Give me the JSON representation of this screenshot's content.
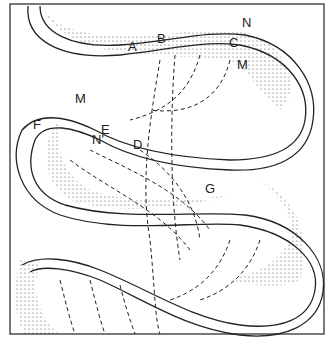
{
  "diagram": {
    "labels": [
      {
        "id": "A",
        "text": "A",
        "x": 128,
        "y": 40
      },
      {
        "id": "B",
        "text": "B",
        "x": 157,
        "y": 32
      },
      {
        "id": "C",
        "text": "C",
        "x": 229,
        "y": 36
      },
      {
        "id": "N1",
        "text": "N",
        "x": 242,
        "y": 16
      },
      {
        "id": "M1",
        "text": "M",
        "x": 237,
        "y": 58
      },
      {
        "id": "M2",
        "text": "M",
        "x": 75,
        "y": 92
      },
      {
        "id": "F",
        "text": "F",
        "x": 33,
        "y": 118
      },
      {
        "id": "E",
        "text": "E",
        "x": 101,
        "y": 123
      },
      {
        "id": "N2",
        "text": "N'",
        "x": 92,
        "y": 133
      },
      {
        "id": "D",
        "text": "D",
        "x": 133,
        "y": 138
      },
      {
        "id": "G",
        "text": "G",
        "x": 205,
        "y": 182
      }
    ],
    "colors": {
      "line": "#222222",
      "stipple": "#cfcfcf",
      "background": "#ffffff"
    }
  }
}
